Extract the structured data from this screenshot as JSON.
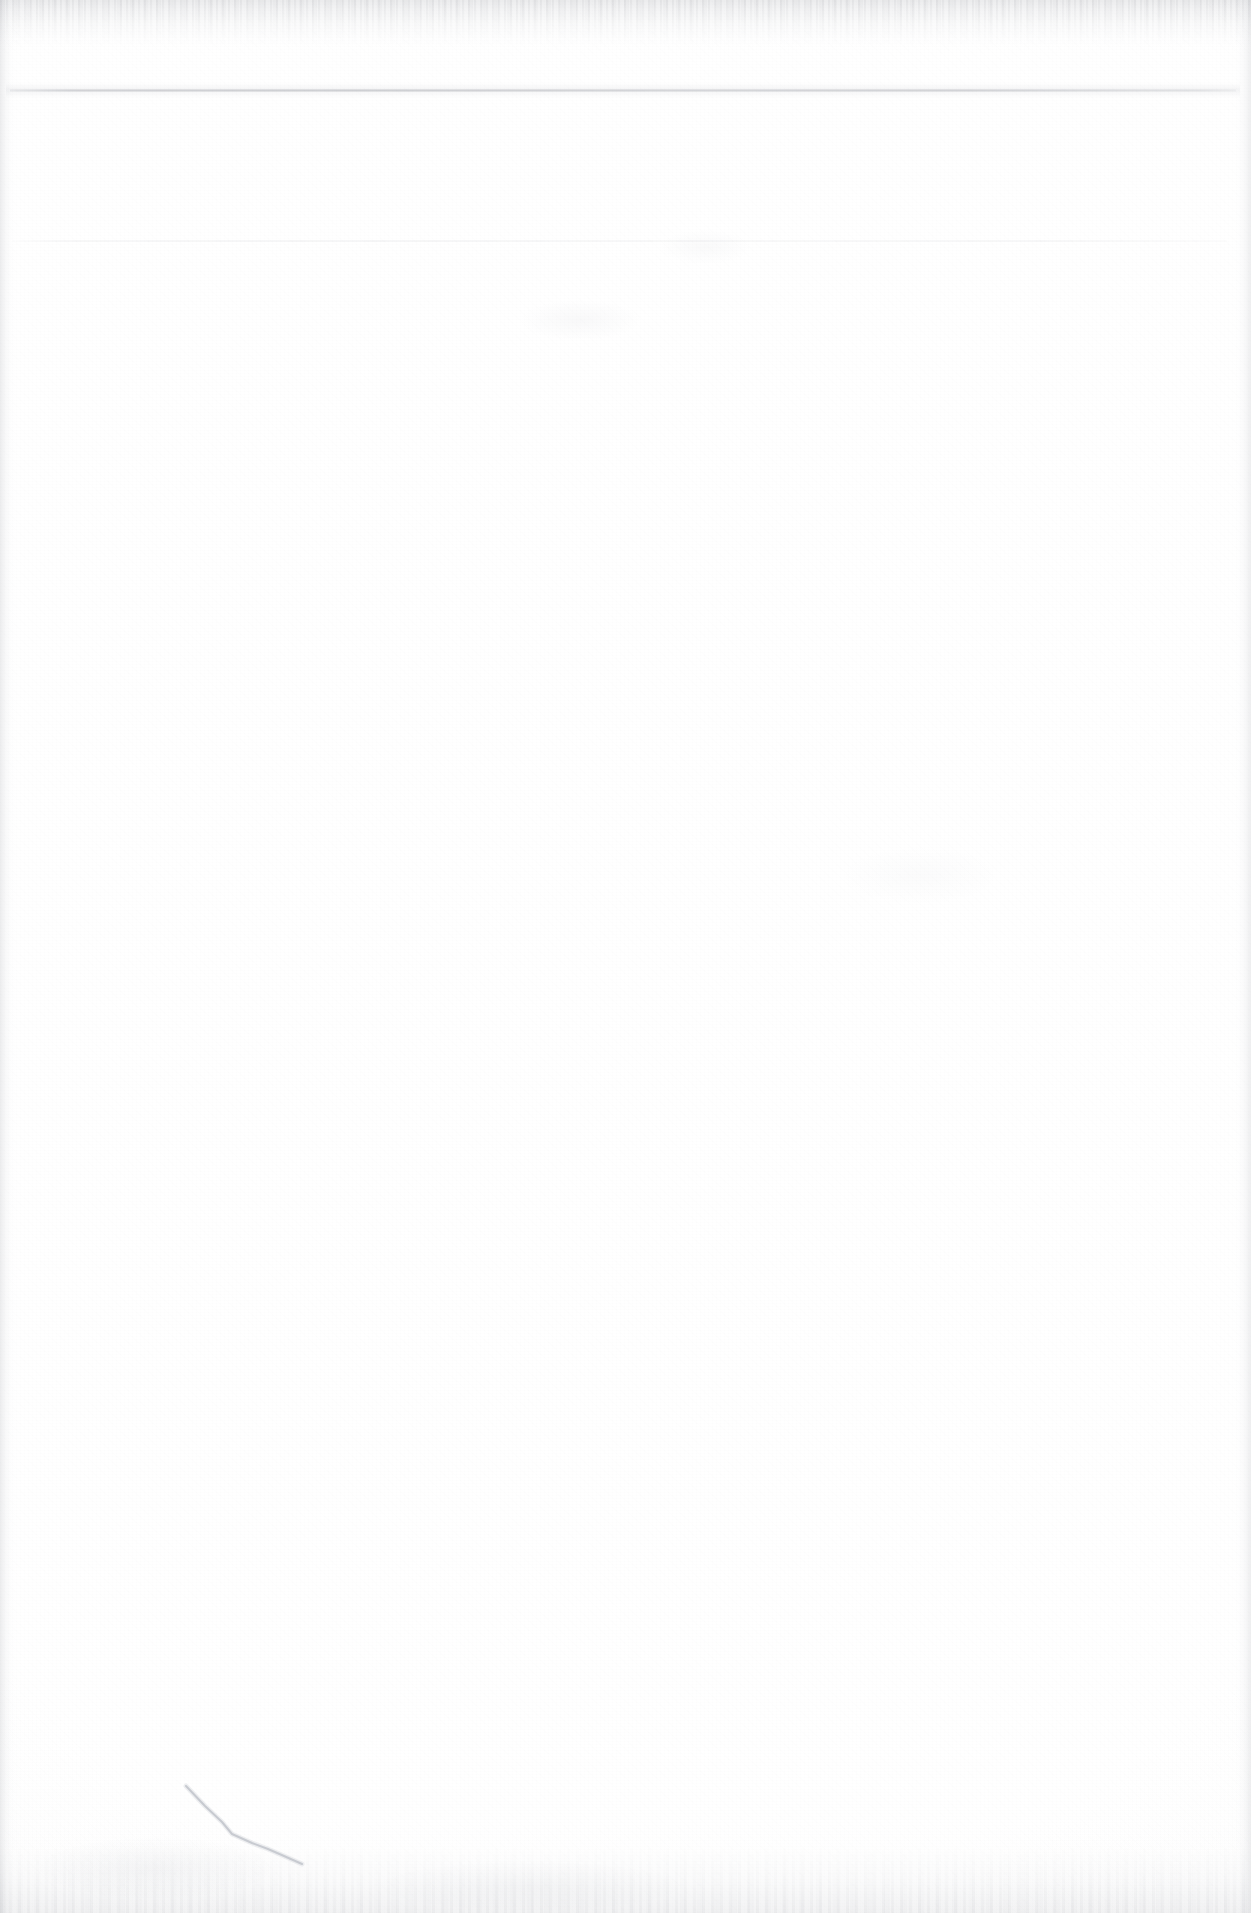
{
  "document": {
    "kind": "scanned-page",
    "page_state": "blank",
    "page_width_px": 1251,
    "page_height_px": 1913,
    "background_color": "#ffffff",
    "description": "Blank scanned paper page with no printed text"
  },
  "marks": {
    "horizontal_rules": [
      {
        "id": "rule-upper",
        "label": "upper horizontal rule",
        "y": 90,
        "x_start": 10,
        "x_end": 1236,
        "thickness_px": 2,
        "color": "#767880",
        "visibility": "faint"
      },
      {
        "id": "rule-lower",
        "label": "lower horizontal rule",
        "y": 240,
        "x_start": 12,
        "x_end": 1227,
        "thickness_px": 1,
        "color": "#9ea0aa",
        "visibility": "very faint"
      }
    ],
    "ink_stroke": {
      "id": "pen-stroke",
      "label": "handwritten diagonal pen stroke",
      "color": "#b9bcc4",
      "stroke_width_px": 2,
      "x_start": 186,
      "y_start": 1786,
      "x_end": 302,
      "y_end": 1864,
      "path": "M 186 1786 L 205 1806 L 222 1822 L 232 1834 L 252 1843 L 268 1849 L 284 1856 L 302 1864",
      "visibility": "faint"
    },
    "scan_edges": {
      "top_band": {
        "label": "top scanner edge band",
        "height_px": 52,
        "color": "#a0a2a8"
      },
      "bottom_band": {
        "label": "bottom scanner edge band",
        "height_px": 90,
        "color": "#afb1b7"
      },
      "left_band": {
        "label": "left scanner edge band",
        "width_px": 16,
        "color": "#a8aab0"
      },
      "right_band": {
        "label": "right scanner edge band",
        "width_px": 18,
        "color": "#aaacb2"
      }
    },
    "smudges": [
      {
        "label": "faint smudge upper-center"
      },
      {
        "label": "faint smudge upper-right-center"
      },
      {
        "label": "faint smudge mid-right"
      },
      {
        "label": "faint smudge bottom-left"
      },
      {
        "label": "faint smudge bottom-center"
      }
    ]
  },
  "accessibility": {
    "page_caption": "Blank scanned document page with two faint horizontal rules near the top and a faint diagonal pen stroke near the lower left."
  }
}
